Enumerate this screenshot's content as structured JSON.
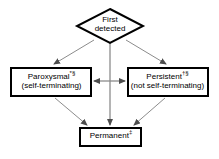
{
  "figure": {
    "background_color": "#ffffff",
    "stroke_color": "#000000",
    "arrow_color": "#808080",
    "node_fill": "#ffffff"
  },
  "nodes": {
    "first_detected": {
      "shape": "diamond",
      "line1": "First",
      "line2": "detected"
    },
    "paroxysmal": {
      "shape": "rectangle",
      "line1_text": "Paroxysmal",
      "line1_marker": "*§",
      "line2": "(self-terminating)"
    },
    "persistent": {
      "shape": "rectangle",
      "line1_text": "Persistent",
      "line1_marker": "†§",
      "line2": "(not self-terminating)"
    },
    "permanent": {
      "shape": "rectangle",
      "line1_text": "Permanent",
      "line1_marker": "‡",
      "line2": ""
    }
  },
  "edges": [
    {
      "name": "first-detected-to-paroxysmal",
      "from": "first_detected",
      "to": "paroxysmal",
      "style": "single-arrow"
    },
    {
      "name": "first-detected-to-persistent",
      "from": "first_detected",
      "to": "persistent",
      "style": "single-arrow"
    },
    {
      "name": "first-detected-to-permanent",
      "from": "first_detected",
      "to": "permanent",
      "style": "single-arrow"
    },
    {
      "name": "paroxysmal-to-persistent",
      "from": "paroxysmal",
      "to": "persistent",
      "style": "double-arrow"
    },
    {
      "name": "paroxysmal-to-permanent",
      "from": "paroxysmal",
      "to": "permanent",
      "style": "single-arrow"
    },
    {
      "name": "persistent-to-permanent",
      "from": "persistent",
      "to": "permanent",
      "style": "single-arrow"
    }
  ]
}
